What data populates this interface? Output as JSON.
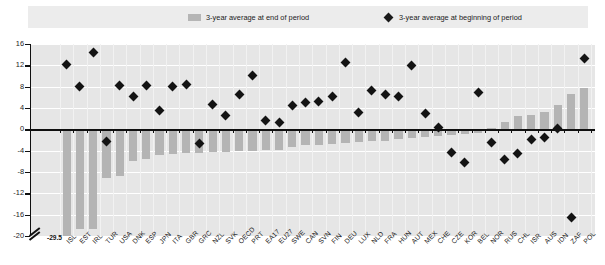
{
  "legend": {
    "bar_label": "3-year average at end of period",
    "diamond_label": "3-year average at beginning of period",
    "bar_swatch_icon": "legend-bar-swatch",
    "diamond_swatch_icon": "legend-diamond-swatch"
  },
  "annotations": {
    "axis_break_value": "-29.5"
  },
  "colors": {
    "bar": "#b4b4b4",
    "diamond": "#131313",
    "plot_background": "#e6e6e6",
    "legend_background": "#ececec",
    "gridline": "#ffffff",
    "axis": "#101010"
  },
  "chart_data": {
    "type": "bar",
    "title": "",
    "subtitle": "",
    "xlabel": "",
    "ylabel": "",
    "ylim": [
      -20,
      16
    ],
    "yticks": [
      -20,
      -16,
      -12,
      -8,
      -4,
      0,
      4,
      8,
      12,
      16
    ],
    "grid": true,
    "legend_position": "top",
    "axis_break": {
      "at": -20,
      "true_value": -29.5,
      "applies_to": "ISL"
    },
    "categories": [
      "ISL",
      "EST",
      "IRL",
      "TUR",
      "USA",
      "DNK",
      "ESP",
      "JPN",
      "ITA",
      "GBR",
      "GRC",
      "NZL",
      "SVK",
      "OECD",
      "PRT",
      "EA17",
      "EU27",
      "SWE",
      "CAN",
      "SVN",
      "FIN",
      "DEU",
      "LUX",
      "NLD",
      "FRA",
      "HUN",
      "AUT",
      "MEX",
      "CHE",
      "CZE",
      "KOR",
      "BEL",
      "NOR",
      "RUS",
      "CHL",
      "ISR",
      "AUS",
      "IDN",
      "ZAF",
      "POL"
    ],
    "series": [
      {
        "name": "3-year average at end of period",
        "type": "bar",
        "values": [
          -29.5,
          -18.6,
          -18.6,
          -9.2,
          -8.8,
          -5.9,
          -5.5,
          -4.9,
          -4.6,
          -4.5,
          -4.4,
          -4.3,
          -4.2,
          -4.1,
          -4.0,
          -3.9,
          -3.8,
          -3.3,
          -3.0,
          -2.9,
          -2.8,
          -2.5,
          -2.3,
          -2.2,
          -2.1,
          -1.9,
          -1.6,
          -1.4,
          -1.2,
          -1.0,
          -0.8,
          -0.6,
          0.3,
          1.4,
          2.5,
          2.7,
          3.3,
          4.6,
          6.7,
          7.8
        ]
      },
      {
        "name": "3-year average at beginning of period",
        "type": "scatter",
        "values": [
          12.2,
          8.1,
          14.5,
          -2.3,
          8.2,
          6.2,
          8.3,
          3.6,
          8.0,
          8.5,
          -2.6,
          4.6,
          2.6,
          6.5,
          10.1,
          1.6,
          1.2,
          4.5,
          5.1,
          5.3,
          6.1,
          12.5,
          3.2,
          7.3,
          6.6,
          6.1,
          11.9,
          3.0,
          0.3,
          -4.4,
          -6.2,
          6.9,
          -2.5,
          -5.6,
          -4.6,
          -1.9,
          -1.5,
          0.1,
          -16.5,
          13.3
        ]
      }
    ]
  }
}
